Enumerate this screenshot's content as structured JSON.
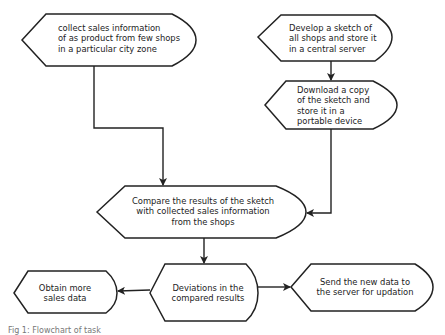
{
  "diagram": {
    "type": "flowchart",
    "stroke_color": "#222222",
    "nodes": [
      {
        "id": "collect",
        "label": "collect sales information\nof as product from few shops\nin a particular city zone"
      },
      {
        "id": "develop",
        "label": "Develop a sketch of\nall shops and store it\nin a central server"
      },
      {
        "id": "download",
        "label": "Download a copy\nof the sketch and\nstore it in a\nportable device"
      },
      {
        "id": "compare",
        "label": "Compare the results of the sketch\nwith collected sales information\nfrom the shops"
      },
      {
        "id": "deviations",
        "label": "Deviations in the\ncompared results"
      },
      {
        "id": "obtain",
        "label": "Obtain more\nsales data"
      },
      {
        "id": "send",
        "label": "Send the new data to\nthe server for updation"
      }
    ],
    "edges": [
      {
        "from": "develop",
        "to": "download"
      },
      {
        "from": "collect",
        "to": "compare"
      },
      {
        "from": "download",
        "to": "compare"
      },
      {
        "from": "compare",
        "to": "deviations"
      },
      {
        "from": "deviations",
        "to": "obtain"
      },
      {
        "from": "deviations",
        "to": "send"
      }
    ]
  },
  "caption": "Fig 1: Flowchart of task"
}
